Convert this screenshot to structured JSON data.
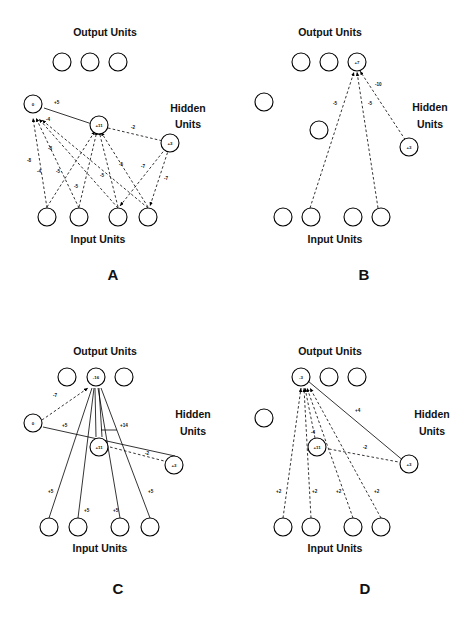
{
  "figure": {
    "background_color": "#ffffff",
    "ink_color": "#000000"
  },
  "labels": {
    "output_units": "Output Units",
    "input_units": "Input Units",
    "hidden_line1": "Hidden",
    "hidden_line2": "Units"
  },
  "panels": [
    {
      "id": "A",
      "letter": "A",
      "output_units": [
        {
          "name": "out-1",
          "value": ""
        },
        {
          "name": "out-2",
          "value": ""
        },
        {
          "name": "out-3",
          "value": ""
        }
      ],
      "hidden_units": [
        {
          "name": "hid-left",
          "value": "0"
        },
        {
          "name": "hid-mid",
          "value": "+11"
        },
        {
          "name": "hid-right",
          "value": "+3"
        }
      ],
      "input_units": [
        {
          "name": "in-1",
          "value": ""
        },
        {
          "name": "in-2",
          "value": ""
        },
        {
          "name": "in-3",
          "value": ""
        },
        {
          "name": "in-4",
          "value": ""
        }
      ],
      "weights": [
        {
          "name": "w-left-to-mid",
          "value": "+5",
          "style": "solid"
        },
        {
          "name": "w-mid-to-right",
          "value": "-2",
          "style": "dashed"
        },
        {
          "name": "w-mid-to-left",
          "value": "-4",
          "style": "dashed"
        },
        {
          "name": "w-in1-to-left",
          "value": "-8",
          "style": "dashed"
        },
        {
          "name": "w-in2-to-left",
          "value": "-4",
          "style": "dashed"
        },
        {
          "name": "w-in3-to-left",
          "value": "-8",
          "style": "dashed"
        },
        {
          "name": "w-in1-to-mid",
          "value": "-5",
          "style": "dashed"
        },
        {
          "name": "w-in2-to-mid",
          "value": "-5",
          "style": "dashed"
        },
        {
          "name": "w-in3-to-mid",
          "value": "-5",
          "style": "dashed"
        },
        {
          "name": "w-in4-to-mid",
          "value": "-5",
          "style": "dashed"
        },
        {
          "name": "w-in3-to-right",
          "value": "-7",
          "style": "dashed"
        },
        {
          "name": "w-in4-to-right",
          "value": "-7",
          "style": "dashed"
        }
      ]
    },
    {
      "id": "B",
      "letter": "B",
      "output_units": [
        {
          "name": "out-1",
          "value": ""
        },
        {
          "name": "out-2",
          "value": ""
        },
        {
          "name": "out-3",
          "value": "+7"
        }
      ],
      "hidden_units": [
        {
          "name": "hid-left",
          "value": ""
        },
        {
          "name": "hid-mid",
          "value": ""
        },
        {
          "name": "hid-right",
          "value": "+3"
        }
      ],
      "input_units": [
        {
          "name": "in-1",
          "value": ""
        },
        {
          "name": "in-2",
          "value": ""
        },
        {
          "name": "in-3",
          "value": ""
        },
        {
          "name": "in-4",
          "value": ""
        }
      ],
      "weights": [
        {
          "name": "w-out-to-hidright",
          "value": "-10",
          "style": "dashed"
        },
        {
          "name": "w-in2-to-out",
          "value": "-5",
          "style": "dashed"
        },
        {
          "name": "w-in4-to-out",
          "value": "-5",
          "style": "dashed"
        }
      ]
    },
    {
      "id": "C",
      "letter": "C",
      "output_units": [
        {
          "name": "out-1",
          "value": ""
        },
        {
          "name": "out-2",
          "value": "-16"
        },
        {
          "name": "out-3",
          "value": ""
        }
      ],
      "hidden_units": [
        {
          "name": "hid-left",
          "value": "0"
        },
        {
          "name": "hid-mid",
          "value": "+11"
        },
        {
          "name": "hid-right",
          "value": "+3"
        }
      ],
      "input_units": [
        {
          "name": "in-1",
          "value": ""
        },
        {
          "name": "in-2",
          "value": ""
        },
        {
          "name": "in-3",
          "value": ""
        },
        {
          "name": "in-4",
          "value": ""
        }
      ],
      "weights": [
        {
          "name": "w-hidleft-to-out",
          "value": "-7",
          "style": "dashed"
        },
        {
          "name": "w-hidleft-to-hidmid",
          "value": "+5",
          "style": "solid"
        },
        {
          "name": "w-hidmid-to-out",
          "value": "+14",
          "style": "solid"
        },
        {
          "name": "w-hidmid-to-hidright",
          "value": "-2",
          "style": "dashed"
        },
        {
          "name": "w-in1-to-out",
          "value": "+5",
          "style": "solid"
        },
        {
          "name": "w-in2-to-out",
          "value": "+5",
          "style": "solid"
        },
        {
          "name": "w-in3-to-out",
          "value": "+5",
          "style": "solid"
        },
        {
          "name": "w-in4-to-out",
          "value": "+5",
          "style": "solid"
        }
      ]
    },
    {
      "id": "D",
      "letter": "D",
      "output_units": [
        {
          "name": "out-1",
          "value": "-3"
        },
        {
          "name": "out-2",
          "value": ""
        },
        {
          "name": "out-3",
          "value": ""
        }
      ],
      "hidden_units": [
        {
          "name": "hid-left",
          "value": ""
        },
        {
          "name": "hid-mid",
          "value": "+11"
        },
        {
          "name": "hid-right",
          "value": "+3"
        }
      ],
      "input_units": [
        {
          "name": "in-1",
          "value": ""
        },
        {
          "name": "in-2",
          "value": ""
        },
        {
          "name": "in-3",
          "value": ""
        },
        {
          "name": "in-4",
          "value": ""
        }
      ],
      "weights": [
        {
          "name": "w-hidright-to-out",
          "value": "+4",
          "style": "solid"
        },
        {
          "name": "w-hidmid-to-out",
          "value": "-4",
          "style": "dashed"
        },
        {
          "name": "w-hidmid-to-hidright",
          "value": "-2",
          "style": "dashed"
        },
        {
          "name": "w-in1-to-out",
          "value": "+2",
          "style": "dashed"
        },
        {
          "name": "w-in2-to-out",
          "value": "+2",
          "style": "dashed"
        },
        {
          "name": "w-in3-to-out",
          "value": "+2",
          "style": "dashed"
        },
        {
          "name": "w-in4-to-out",
          "value": "+2",
          "style": "dashed"
        }
      ]
    }
  ]
}
